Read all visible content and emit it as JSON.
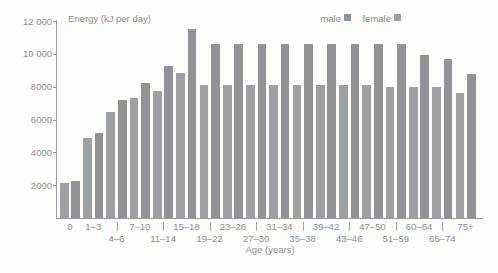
{
  "chart_data": {
    "type": "bar",
    "title": "Energy (kJ per day)",
    "xlabel": "Age (years)",
    "ylabel": "",
    "ylim": [
      0,
      12000
    ],
    "ytick_step": 2000,
    "ytick_labels": [
      "2000",
      "4000",
      "6000",
      "8000",
      "10 000",
      "12 000"
    ],
    "grid": false,
    "legend_position": "top-right",
    "bar_order_within_pair": [
      "female",
      "male"
    ],
    "categories": [
      "0",
      "1–3",
      "4–6",
      "7–10",
      "11–14",
      "15–18",
      "19–22",
      "23–26",
      "27–30",
      "31–34",
      "35–38",
      "39–42",
      "43–46",
      "47–50",
      "51–59",
      "60–64",
      "65–74",
      "75+"
    ],
    "series": [
      {
        "name": "male",
        "color": "#909295",
        "values": [
          2280,
          5150,
          7160,
          8240,
          9270,
          11510,
          10600,
          10600,
          10600,
          10600,
          10600,
          10600,
          10600,
          10600,
          10600,
          9930,
          9710,
          8770
        ]
      },
      {
        "name": "female",
        "color": "#9da0a2",
        "values": [
          2160,
          4860,
          6460,
          7280,
          7720,
          8830,
          8100,
          8100,
          8100,
          8100,
          8100,
          8100,
          8100,
          8100,
          8000,
          7990,
          7960,
          7610
        ]
      }
    ],
    "axis_color": "#9b9b9b",
    "text_color": "#8c8c8c"
  }
}
